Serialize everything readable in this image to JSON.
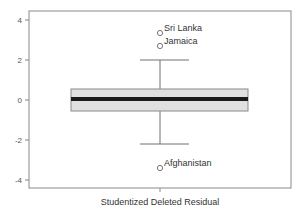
{
  "chart_data": {
    "type": "box",
    "title": "",
    "xlabel": "Studentized Deleted Residual",
    "ylabel": "",
    "ylim": [
      -4.5,
      4.4
    ],
    "yticks": [
      4,
      2,
      0,
      -2,
      -4
    ],
    "ytick_labels": [
      "4",
      "2",
      "0",
      "-2",
      "-4"
    ],
    "grid": false,
    "box": {
      "q1": -0.55,
      "median": 0.05,
      "q3": 0.55,
      "whisker_low": -2.2,
      "whisker_high": 2.0
    },
    "outliers": [
      {
        "label": "Sri Lanka",
        "value": 3.35
      },
      {
        "label": "Jamaica",
        "value": 2.7
      },
      {
        "label": "Afghanistan",
        "value": -3.4
      }
    ],
    "colors": {
      "box_fill": "#e0e0e0",
      "median": "#1a1a1a",
      "axis": "#808080",
      "whisker": "#707070"
    }
  }
}
